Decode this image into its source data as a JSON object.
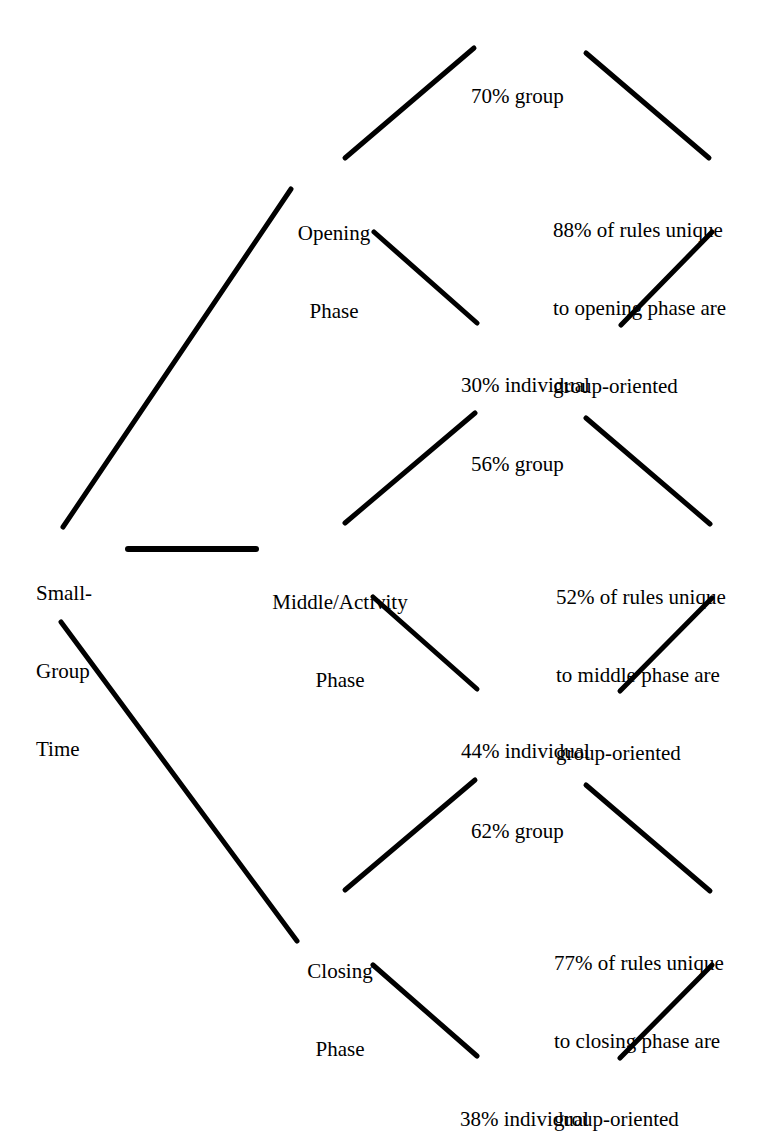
{
  "diagram": {
    "type": "tree",
    "background_color": "#ffffff",
    "edge_color": "#000000",
    "text_color": "#000000",
    "root": {
      "id": "root",
      "lines": [
        "Small-",
        "Group",
        "Time"
      ],
      "align": "left"
    },
    "phases": [
      {
        "id": "opening",
        "lines": [
          "Opening",
          "Phase"
        ],
        "group": {
          "id": "opening-group",
          "lines": [
            "70% group"
          ],
          "value": 70,
          "label": "group"
        },
        "individual": {
          "id": "opening-individual",
          "lines": [
            "30% individual"
          ],
          "value": 30,
          "label": "individual"
        },
        "summary": {
          "id": "opening-summary",
          "lines": [
            "88% of rules unique",
            "to opening phase are",
            "group-oriented"
          ],
          "value": 88
        }
      },
      {
        "id": "middle",
        "lines": [
          "Middle/Activity",
          "Phase"
        ],
        "group": {
          "id": "middle-group",
          "lines": [
            "56% group"
          ],
          "value": 56,
          "label": "group"
        },
        "individual": {
          "id": "middle-individual",
          "lines": [
            "44% individual"
          ],
          "value": 44,
          "label": "individual"
        },
        "summary": {
          "id": "middle-summary",
          "lines": [
            "52% of rules unique",
            "to middle phase are",
            "group-oriented"
          ],
          "value": 52
        }
      },
      {
        "id": "closing",
        "lines": [
          "Closing",
          "Phase"
        ],
        "group": {
          "id": "closing-group",
          "lines": [
            "62% group"
          ],
          "value": 62,
          "label": "group"
        },
        "individual": {
          "id": "closing-individual",
          "lines": [
            "38% individual"
          ],
          "value": 38,
          "label": "individual"
        },
        "summary": {
          "id": "closing-summary",
          "lines": [
            "77% of rules unique",
            "to closing phase are",
            "group-oriented"
          ],
          "value": 77
        }
      }
    ]
  },
  "nodes": {
    "root": {
      "l0": "Small-",
      "l1": "Group",
      "l2": "Time"
    },
    "opening": {
      "l0": "Opening",
      "l1": "Phase"
    },
    "opening_group": {
      "l0": "70% group"
    },
    "opening_individual": {
      "l0": "30% individual"
    },
    "opening_summary": {
      "l0": "88% of rules unique",
      "l1": "to opening phase are",
      "l2": "group-oriented"
    },
    "middle": {
      "l0": "Middle/Activity",
      "l1": "Phase"
    },
    "middle_group": {
      "l0": "56% group"
    },
    "middle_individual": {
      "l0": "44% individual"
    },
    "middle_summary": {
      "l0": "52% of rules unique",
      "l1": "to middle phase are",
      "l2": "group-oriented"
    },
    "closing": {
      "l0": "Closing",
      "l1": "Phase"
    },
    "closing_group": {
      "l0": "62% group"
    },
    "closing_individual": {
      "l0": "38% individual"
    },
    "closing_summary": {
      "l0": "77% of rules unique",
      "l1": "to closing phase are",
      "l2": "group-oriented"
    }
  }
}
